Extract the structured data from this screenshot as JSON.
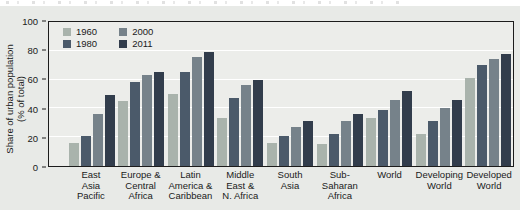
{
  "y_axis": {
    "title_line1": "Share of urban population",
    "title_line2": "(% of total)"
  },
  "chart_data": {
    "type": "bar",
    "title": "",
    "xlabel": "",
    "ylabel": "Share of urban population (% of total)",
    "ylim": [
      0,
      100
    ],
    "yticks": [
      0,
      20,
      40,
      60,
      80,
      100
    ],
    "gridlines": [
      20,
      40,
      60,
      80
    ],
    "grid": true,
    "legend_position": "top-left-inside",
    "legend_order": "column-major",
    "categories": [
      "East Asia Pacific",
      "Europe & Central Africa",
      "Latin America & Caribbean",
      "Middle East & N. Africa",
      "South Asia",
      "Sub-Saharan Africa",
      "World",
      "Developing World",
      "Developed World"
    ],
    "category_label_lines": [
      [
        "East",
        "Asia",
        "Pacific"
      ],
      [
        "Europe &",
        "Central",
        "Africa"
      ],
      [
        "Latin",
        "America &",
        "Caribbean"
      ],
      [
        "Middle",
        "East &",
        "N. Africa"
      ],
      [
        "South",
        "Asia"
      ],
      [
        "Sub-Saharan",
        "Africa"
      ],
      [
        "World"
      ],
      [
        "Developing",
        "World"
      ],
      [
        "Developed",
        "World"
      ]
    ],
    "series": [
      {
        "name": "1960",
        "color": "#a9b3ac",
        "values": [
          16,
          45,
          50,
          33,
          16,
          15,
          33,
          22,
          61
        ]
      },
      {
        "name": "1980",
        "color": "#4b5a6a",
        "values": [
          21,
          58,
          65,
          47,
          21,
          22,
          39,
          31,
          70
        ]
      },
      {
        "name": "2000",
        "color": "#76828a",
        "values": [
          36,
          63,
          76,
          56,
          27,
          31,
          46,
          40,
          74
        ]
      },
      {
        "name": "2011",
        "color": "#323d4c",
        "values": [
          49,
          65,
          79,
          60,
          31,
          36,
          52,
          46,
          78
        ]
      }
    ],
    "colors": {
      "panel_background": "#e8eae7",
      "plot_background": "#ecedea",
      "gridline": "#ffffff",
      "axis": "#1c1c1c",
      "text": "#1a1a1a"
    }
  }
}
